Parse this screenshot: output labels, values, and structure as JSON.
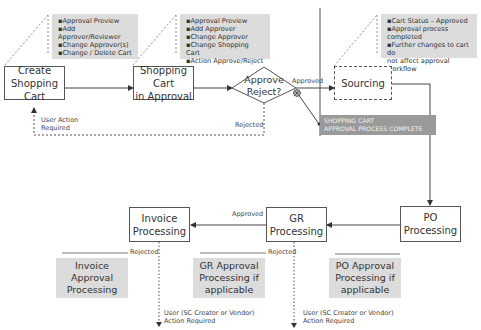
{
  "diagram": {
    "type": "process-flow",
    "nodes": {
      "create_cart": {
        "label_line1": "Create",
        "label_line2": "Shopping Cart"
      },
      "cart_in_approval": {
        "label_line1": "Shopping Cart",
        "label_line2": "in Approval"
      },
      "approve_decision": {
        "label_line1": "Approve",
        "label_line2": "Reject?"
      },
      "sourcing": {
        "label": "Sourcing"
      },
      "po_processing": {
        "label": "PO Processing"
      },
      "gr_processing": {
        "label": "GR Processing"
      },
      "invoice_processing": {
        "label_line1": "Invoice",
        "label_line2": "Processing"
      }
    },
    "notes": {
      "create_cart": [
        "Approval Preview",
        "Add Approver/Reviewer",
        "Change Approver(s)",
        "Change  / Delete Cart"
      ],
      "cart_in_approval": [
        "Approval Preview",
        "Add Approver",
        "Change Approver",
        "Change Shopping Cart",
        "Action  Approve/Reject"
      ],
      "sourcing": [
        "Cart Status – Approved",
        "Approval process completed",
        "Further changes to cart  do",
        "not affect approval workflow"
      ]
    },
    "banner": {
      "line1": "SHOPPING CART",
      "line2": "APPROVAL PROCESS COMPLETE"
    },
    "approval_boxes": {
      "invoice": {
        "line1": "Invoice",
        "line2": "Approval",
        "line3": "Processing"
      },
      "gr": {
        "line1": "GR Approval",
        "line2": "Processing if",
        "line3": "applicable"
      },
      "po": {
        "line1": "PO Approval",
        "line2": "Processing if",
        "line3": "applicable"
      }
    },
    "edge_labels": {
      "approved_top": "Approved",
      "rejected_top": "Rejected",
      "user_action_line1": "User Action",
      "user_action_line2": "Required",
      "approved_bottom": "Approved",
      "rejected_invoice": "Rejected",
      "rejected_gr": "Rejected",
      "user_sc_line1": "User (SC Creator or Vendor)",
      "user_sc_line2": "Action Required",
      "user_sc2_line1": "User (SC Creator or Vendor)",
      "user_sc2_line2": "Action Required"
    },
    "colors": {
      "note_bg": "#dcdcdc",
      "banner_bg": "#9a9a9a",
      "line": "#444444"
    }
  }
}
